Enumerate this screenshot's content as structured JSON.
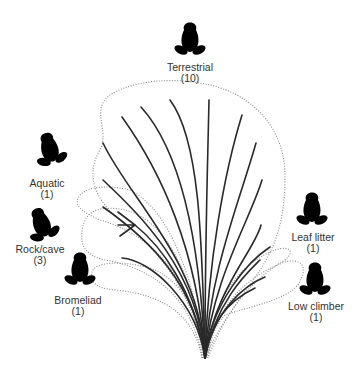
{
  "diagram": {
    "type": "phylogenetic tree with ecological group outlines",
    "groups": [
      {
        "id": "terrestrial",
        "name": "Terrestrial",
        "count": "(10)",
        "icon": "frog-icon"
      },
      {
        "id": "aquatic",
        "name": "Aquatic",
        "count": "(1)",
        "icon": "frog-icon"
      },
      {
        "id": "rockcave",
        "name": "Rock/cave",
        "count": "(3)",
        "icon": "frog-icon"
      },
      {
        "id": "bromeliad",
        "name": "Bromeliad",
        "count": "(1)",
        "icon": "frog-icon"
      },
      {
        "id": "leaflitter",
        "name": "Leaf litter",
        "count": "(1)",
        "icon": "frog-icon"
      },
      {
        "id": "lowclimber",
        "name": "Low climber",
        "count": "(1)",
        "icon": "frog-icon"
      }
    ],
    "colors": {
      "branch": "#2a2a2a",
      "outline": "#8a8a8a",
      "text": "#333333",
      "background": "#ffffff"
    }
  }
}
